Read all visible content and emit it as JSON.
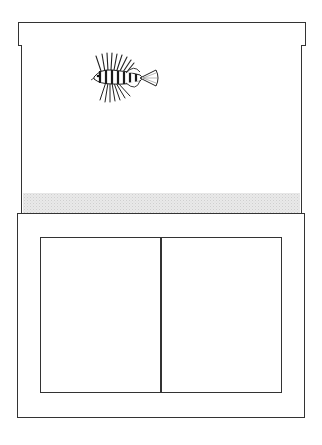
{
  "diagram": {
    "components": [
      {
        "name": "lid",
        "shape": "rectangle"
      },
      {
        "name": "tank",
        "shape": "rectangle",
        "contents": [
          "lionfish",
          "gravel"
        ]
      },
      {
        "name": "stand",
        "shape": "rectangle"
      },
      {
        "name": "cabinet-doors",
        "count": 2
      }
    ],
    "colors": {
      "stroke": "#333333",
      "background": "#ffffff",
      "gravel": "#e9e9e9"
    }
  }
}
